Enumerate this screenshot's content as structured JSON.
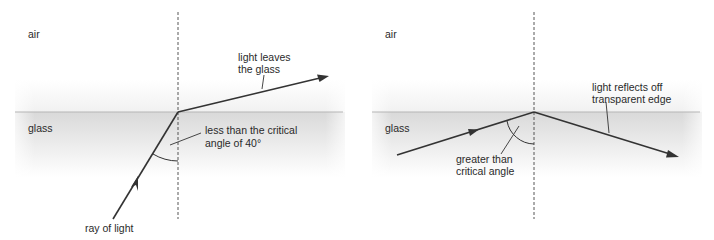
{
  "panels": [
    {
      "id": "refraction",
      "medium_top": "air",
      "medium_bottom": "glass",
      "incident_label": "ray of light",
      "outgoing_label_line1": "light leaves",
      "outgoing_label_line2": "the glass",
      "angle_label_line1": "less than the critical",
      "angle_label_line2": "angle of 40°"
    },
    {
      "id": "total-internal-reflection",
      "medium_top": "air",
      "medium_bottom": "glass",
      "outgoing_label_line1": "light reflects off",
      "outgoing_label_line2": "transparent edge",
      "angle_label_line1": "greater than",
      "angle_label_line2": "critical angle"
    }
  ],
  "colors": {
    "ray": "#333333",
    "interface": "#b5b5b5",
    "glass_top": "#dcdcdc",
    "normal": "#444444",
    "text": "#2a2a2a"
  }
}
